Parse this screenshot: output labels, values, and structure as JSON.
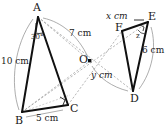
{
  "figure": {
    "background_color": "#ffffff",
    "stroke_color": "#1a1a1a",
    "dash_color": "#9a9a9a",
    "arc_color": "#8a8a8a",
    "vertices": [
      {
        "id": "A",
        "label": "A",
        "x": 38,
        "y": 17
      },
      {
        "id": "B",
        "label": "B",
        "x": 22,
        "y": 112
      },
      {
        "id": "C",
        "label": "C",
        "x": 68,
        "y": 105
      },
      {
        "id": "O",
        "label": "O",
        "x": 90,
        "y": 61
      },
      {
        "id": "D",
        "label": "D",
        "x": 133,
        "y": 91
      },
      {
        "id": "E",
        "label": "E",
        "x": 148,
        "y": 22
      },
      {
        "id": "F",
        "label": "F",
        "x": 122,
        "y": 31
      }
    ],
    "measurements": [
      {
        "id": "side-ab",
        "label": "10 cm",
        "value": 10,
        "unit": "cm",
        "segment": "AB"
      },
      {
        "id": "side-bc",
        "label": "5 cm",
        "value": 5,
        "unit": "cm",
        "segment": "BC"
      },
      {
        "id": "seg-ao",
        "label": "7 cm",
        "value": 7,
        "unit": "cm",
        "segment": "AO"
      },
      {
        "id": "seg-od",
        "label": "y cm",
        "value": "y",
        "unit": "cm",
        "segment": "OD"
      },
      {
        "id": "side-fe",
        "label": "x cm",
        "value": "x",
        "unit": "cm",
        "segment": "FE"
      },
      {
        "id": "side-ed",
        "label": "6 cm",
        "value": 6,
        "unit": "cm",
        "segment": "ED"
      }
    ],
    "angles": [
      {
        "id": "angle-a",
        "label": "30",
        "symbol": "°",
        "at": "A",
        "text": "30°"
      },
      {
        "id": "angle-z",
        "label": "z",
        "at": "E",
        "text": "z"
      }
    ],
    "right_angles": [
      {
        "id": "right-angle-c",
        "at": "C"
      },
      {
        "id": "right-angle-e",
        "at": "E"
      }
    ],
    "solid_edges": [
      "AB",
      "BC",
      "CA",
      "FE",
      "ED",
      "DF"
    ],
    "dashed_rays": [
      "AO",
      "OD",
      "BO",
      "OE",
      "CO",
      "OF",
      "AC-dash",
      "BC-dash"
    ]
  }
}
